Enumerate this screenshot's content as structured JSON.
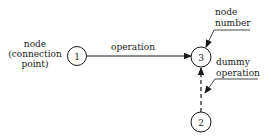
{
  "diagram": {
    "nodes": [
      {
        "id": "node-1",
        "number": "1"
      },
      {
        "id": "node-2",
        "number": "2"
      },
      {
        "id": "node-3",
        "number": "3"
      }
    ],
    "edges": [
      {
        "from": "1",
        "to": "3",
        "style": "solid",
        "label": "operation"
      },
      {
        "from": "2",
        "to": "3",
        "style": "dashed",
        "label": ""
      }
    ],
    "annotations": {
      "node_label": [
        "node",
        "(connection",
        "point)"
      ],
      "node_number_label": [
        "node",
        "number"
      ],
      "dummy_label": [
        "dummy",
        "operation"
      ]
    },
    "colors": {
      "stroke": "#1a1a1a",
      "background": "#ffffff"
    }
  }
}
